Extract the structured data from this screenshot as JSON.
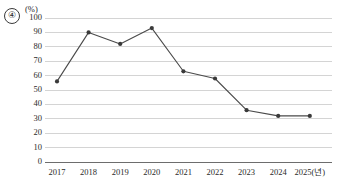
{
  "marker": {
    "label": "④"
  },
  "chart_data": {
    "type": "line",
    "title": "",
    "subtitle": "",
    "xlabel": "(년)",
    "ylabel": "",
    "yunit": "(%)",
    "categories": [
      "2017",
      "2018",
      "2019",
      "2020",
      "2021",
      "2022",
      "2023",
      "2024",
      "2025"
    ],
    "x_tick_labels": [
      "2017",
      "2018",
      "2019",
      "2020",
      "2021",
      "2022",
      "2023",
      "2024",
      "2025(년)"
    ],
    "values": [
      56,
      90,
      82,
      93,
      63,
      58,
      36,
      32,
      32
    ],
    "series": [
      {
        "name": "",
        "values": [
          56,
          90,
          82,
          93,
          63,
          58,
          36,
          32,
          32
        ]
      }
    ],
    "ylim": [
      0,
      100
    ],
    "y_tick_labels": [
      "100",
      "90",
      "80",
      "70",
      "60",
      "50",
      "40",
      "30",
      "20",
      "10",
      "0"
    ],
    "y_tick_values": [
      100,
      90,
      80,
      70,
      60,
      50,
      40,
      30,
      20,
      10,
      0
    ],
    "grid": true,
    "legend": "none",
    "line_color": "#4a4a4a",
    "marker_color": "#3a3a3a",
    "grid_color": "#d4d4d4",
    "axis_color": "#6d6d6d"
  }
}
